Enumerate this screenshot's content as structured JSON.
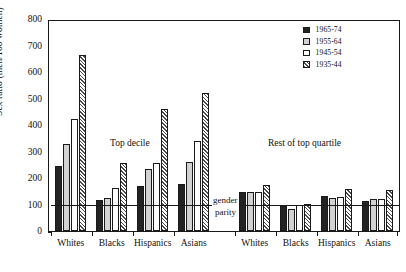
{
  "chart_data": {
    "type": "bar",
    "title": "",
    "xlabel": "",
    "ylabel": "Sex ratio (men/100 women)",
    "ylim": [
      0,
      800
    ],
    "ytick_values": [
      0,
      100,
      200,
      300,
      400,
      500,
      600,
      700,
      800
    ],
    "ytick_labels": [
      "0",
      "100",
      "200",
      "300",
      "400",
      "500",
      "600",
      "700",
      "800"
    ],
    "grid": false,
    "legend_position": "top-right",
    "panels": [
      {
        "name": "Top decile",
        "categories": [
          "Whites",
          "Blacks",
          "Hispanics",
          "Asians"
        ],
        "series": [
          {
            "name": "1965-74",
            "values": [
              248,
              120,
              170,
              180
            ]
          },
          {
            "name": "1955-64",
            "values": [
              330,
              127,
              235,
              263
            ]
          },
          {
            "name": "1945-54",
            "values": [
              425,
              162,
              260,
              343
            ]
          },
          {
            "name": "1935-44",
            "values": [
              670,
              260,
              463,
              525
            ]
          }
        ]
      },
      {
        "name": "Rest of top quartile",
        "categories": [
          "Whites",
          "Blacks",
          "Hispanics",
          "Asians"
        ],
        "series": [
          {
            "name": "1965-74",
            "values": [
              148,
              97,
              135,
              115
            ]
          },
          {
            "name": "1955-64",
            "values": [
              148,
              85,
              125,
              122
            ]
          },
          {
            "name": "1945-54",
            "values": [
              150,
              100,
              128,
              122
            ]
          },
          {
            "name": "1935-44",
            "values": [
              175,
              103,
              160,
              155
            ]
          }
        ]
      }
    ],
    "annotations": [
      {
        "text": "Top decile",
        "value": null
      },
      {
        "text": "Rest of top quartile",
        "value": null
      },
      {
        "text": "gender",
        "value": 100
      },
      {
        "text": "parity",
        "value": 100
      }
    ],
    "reference_line": {
      "label": "gender parity",
      "value": 100
    },
    "legend": [
      {
        "label": "1965-74",
        "fill": "black",
        "color": "#232323"
      },
      {
        "label": "1955-64",
        "fill": "gray",
        "color": "#d2d2d2"
      },
      {
        "label": "1945-54",
        "fill": "white",
        "color": "#ffffff"
      },
      {
        "label": "1935-44",
        "fill": "hatch",
        "color": "#ffffff"
      }
    ]
  },
  "axis": {
    "y_label": "Sex ratio (men/100 women)",
    "y_ticks": [
      "800",
      "700",
      "600",
      "500",
      "400",
      "300",
      "200",
      "100",
      "0"
    ]
  },
  "x_labels": [
    "Whites",
    "Blacks",
    "Hispanics",
    "Asians",
    "Whites",
    "Blacks",
    "Hispanics",
    "Asians"
  ],
  "panel_labels": {
    "left": "Top decile",
    "right": "Rest of top quartile"
  },
  "parity_label": {
    "line1": "gender",
    "line2": "parity"
  }
}
